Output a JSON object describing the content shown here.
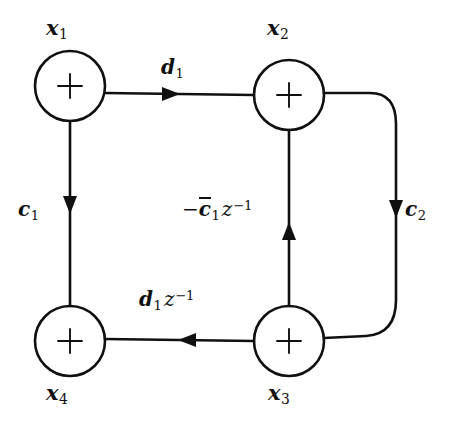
{
  "diagram": {
    "background_color": "#ffffff",
    "stroke_color": "#101010",
    "nodes": [
      {
        "id": "x1",
        "label_parts": {
          "base": "x",
          "sub": "1"
        },
        "operator": "+",
        "cx": 70,
        "cy": 86,
        "r": 35,
        "label_position": "above"
      },
      {
        "id": "x2",
        "label_parts": {
          "base": "x",
          "sub": "2"
        },
        "operator": "+",
        "cx": 289,
        "cy": 95,
        "r": 35,
        "label_position": "above"
      },
      {
        "id": "x3",
        "label_parts": {
          "base": "x",
          "sub": "3"
        },
        "operator": "+",
        "cx": 289,
        "cy": 341,
        "r": 35,
        "label_position": "below"
      },
      {
        "id": "x4",
        "label_parts": {
          "base": "x",
          "sub": "4"
        },
        "operator": "+",
        "cx": 70,
        "cy": 341,
        "r": 35,
        "label_position": "below"
      }
    ],
    "edges": [
      {
        "id": "x1-to-x2",
        "from": "x1",
        "to": "x2",
        "direction": "right",
        "label": "d1",
        "label_text": "d₁"
      },
      {
        "id": "x1-to-x4",
        "from": "x1",
        "to": "x4",
        "direction": "down",
        "label": "c1",
        "label_text": "c₁"
      },
      {
        "id": "x2-to-x3",
        "from": "x2",
        "to": "x3",
        "direction": "down",
        "label": "c2",
        "label_text": "c₂"
      },
      {
        "id": "x3-to-x2",
        "from": "x3",
        "to": "x2",
        "direction": "up",
        "label": "cbar1z1",
        "label_text": "−c̄₁z⁻¹"
      },
      {
        "id": "x3-to-x4",
        "from": "x3",
        "to": "x4",
        "direction": "left",
        "label": "d1z1",
        "label_text": "d₁z⁻¹"
      }
    ],
    "operator_symbol": "+",
    "labels": {
      "x1": {
        "base": "x",
        "sub": "1"
      },
      "x2": {
        "base": "x",
        "sub": "2"
      },
      "x3": {
        "base": "x",
        "sub": "3"
      },
      "x4": {
        "base": "x",
        "sub": "4"
      },
      "d1": {
        "base": "d",
        "sub": "1"
      },
      "c1": {
        "base": "c",
        "sub": "1"
      },
      "c2": {
        "base": "c",
        "sub": "2"
      },
      "cbar1z1": {
        "minus": "−",
        "base": "c",
        "bar": true,
        "sub": "1",
        "zvar": "z",
        "sup": "−1"
      },
      "d1z1": {
        "base": "d",
        "sub": "1",
        "zvar": "z",
        "sup": "−1"
      }
    }
  }
}
